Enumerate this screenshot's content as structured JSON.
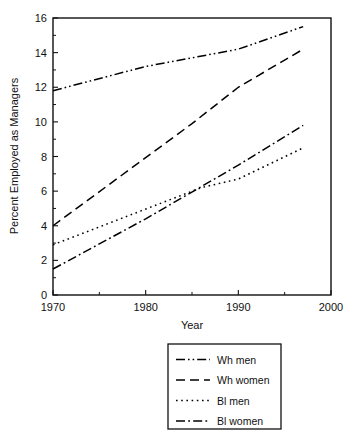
{
  "chart_data": {
    "type": "line",
    "title": "",
    "xlabel": "Year",
    "ylabel": "Percent Employed as Managers",
    "xlim": [
      1970,
      2000
    ],
    "ylim": [
      0,
      16
    ],
    "xticks": [
      1970,
      1980,
      1990,
      2000
    ],
    "xticklabels": [
      "1970",
      "1980",
      "1990",
      "2000"
    ],
    "xminorticks": [
      1975,
      1985,
      1995
    ],
    "yticks": [
      0,
      2,
      4,
      6,
      8,
      10,
      12,
      14,
      16
    ],
    "yticklabels": [
      "0",
      "2",
      "4",
      "6",
      "8",
      "10",
      "12",
      "14",
      "16"
    ],
    "grid": false,
    "legend_position": "below-center",
    "series": [
      {
        "name": "Wh men",
        "style": "dash-dot-dot",
        "x": [
          1970,
          1980,
          1990,
          1997
        ],
        "values": [
          11.8,
          13.2,
          14.2,
          15.5
        ]
      },
      {
        "name": "Wh women",
        "style": "dashed",
        "x": [
          1970,
          1985,
          1990,
          1997
        ],
        "values": [
          4.0,
          9.9,
          12.0,
          14.2
        ]
      },
      {
        "name": "Bl men",
        "style": "dotted",
        "x": [
          1970,
          1986,
          1990,
          1997
        ],
        "values": [
          2.9,
          6.2,
          6.7,
          8.5
        ]
      },
      {
        "name": "Bl women",
        "style": "dash-dot",
        "x": [
          1970,
          1980,
          1990,
          1997
        ],
        "values": [
          1.5,
          4.4,
          7.5,
          9.8
        ]
      }
    ]
  },
  "legend": {
    "entries": [
      {
        "label": "Wh men",
        "style": "dash-dot-dot"
      },
      {
        "label": "Wh women",
        "style": "dashed"
      },
      {
        "label": "Bl men",
        "style": "dotted"
      },
      {
        "label": "Bl women",
        "style": "dash-dot"
      }
    ]
  }
}
